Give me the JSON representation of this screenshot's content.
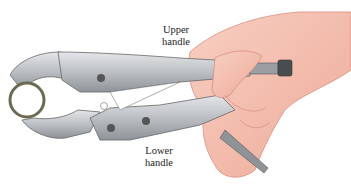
{
  "figure": {
    "labels": {
      "upper_handle": [
        "Upper",
        "handle"
      ],
      "lower_handle": [
        "Lower",
        "handle"
      ]
    },
    "colors": {
      "metal": "#b9bcc0",
      "metal_dark": "#7d8186",
      "skin": "#f2b9a8",
      "skin_line": "#d88e80",
      "pipe": "#6b6a50",
      "text": "#222222"
    }
  }
}
